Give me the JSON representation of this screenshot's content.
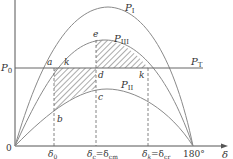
{
  "axes": {
    "origin_label": "0",
    "y_level_label": "P",
    "y_level_sub": "0",
    "x_axis_label": "δ",
    "x_ticks": [
      {
        "main": "δ",
        "sub": "0"
      },
      {
        "main": "δ",
        "sub": "c",
        "eq": "=δ",
        "sub2": "cm"
      },
      {
        "main": "δ",
        "sub": "k",
        "eq": "=δ",
        "sub2": "cr"
      },
      {
        "main": "180°"
      }
    ]
  },
  "curves": {
    "p1": {
      "main": "P",
      "sub": "I"
    },
    "p3": {
      "main": "P",
      "sub": "III"
    },
    "p2": {
      "main": "P",
      "sub": "II"
    },
    "pt": {
      "main": "P",
      "sub": "T"
    }
  },
  "points": {
    "a": "a",
    "k1": "k",
    "e": "e",
    "d": "d",
    "k2": "k",
    "b": "b",
    "c": "c"
  },
  "colors": {
    "curve": "#8a8a8a",
    "axis": "#555555",
    "hatch": "#444444"
  }
}
